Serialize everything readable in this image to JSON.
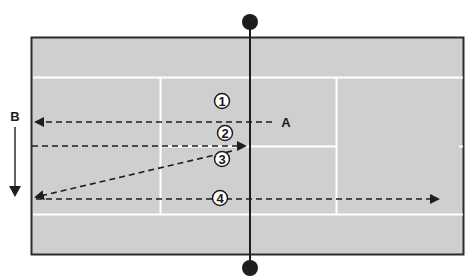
{
  "diagram": {
    "title": "",
    "type": "tennis-court-drill",
    "colors": {
      "court": "#cfcfcf",
      "court_border": "#2b2b2b",
      "court_lines": "#ffffff",
      "net": "#1e1e1e",
      "arrows": "#1e1e1e",
      "background": "#ffffff"
    },
    "labels": {
      "a": "A",
      "b": "B"
    },
    "steps": [
      {
        "number": "1",
        "glyph": "①",
        "description": "Ball from A hit cross to left baseline (top)"
      },
      {
        "number": "2",
        "glyph": "②",
        "description": "B returns toward net center"
      },
      {
        "number": "3",
        "glyph": "③",
        "description": "Ball hit diagonally back to left baseline (bottom)"
      },
      {
        "number": "4",
        "glyph": "④",
        "description": "B hits deep down the line to opposite baseline"
      }
    ]
  }
}
